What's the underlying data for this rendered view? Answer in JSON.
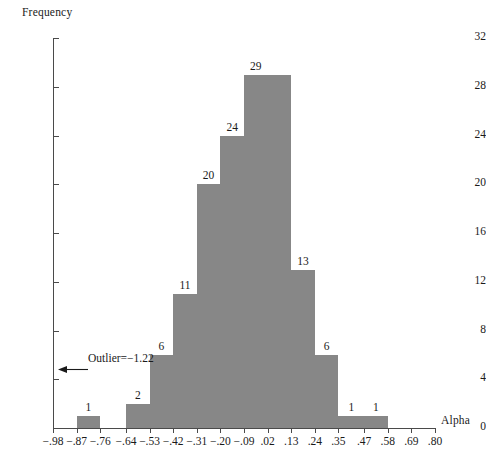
{
  "chart_data": {
    "type": "bar",
    "title": "",
    "subtitle": "",
    "xlabel": "Alpha",
    "ylabel": "Frequency",
    "grid": false,
    "legend": "none",
    "xlim": [
      -0.98,
      0.8
    ],
    "ylim": [
      0,
      32
    ],
    "bin_width": 0.11,
    "x_tick_labels": [
      "−.98",
      "−.87",
      "−.76",
      "−.64",
      "−.53",
      "−.42",
      "−.31",
      "−.20",
      "−.09",
      ".02",
      ".13",
      ".24",
      ".35",
      ".47",
      ".58",
      ".69",
      ".80"
    ],
    "x_tick_values": [
      -0.98,
      -0.87,
      -0.76,
      -0.64,
      -0.53,
      -0.42,
      -0.31,
      -0.2,
      -0.09,
      0.02,
      0.13,
      0.24,
      0.35,
      0.47,
      0.58,
      0.69,
      0.8
    ],
    "y_tick_labels": [
      "0",
      "4",
      "8",
      "12",
      "16",
      "20",
      "24",
      "28",
      "32"
    ],
    "y_tick_values": [
      0,
      4,
      8,
      12,
      16,
      20,
      24,
      28,
      32
    ],
    "bars": [
      {
        "bin_start": -0.87,
        "bin_end": -0.76,
        "value": 1,
        "label": "1"
      },
      {
        "bin_start": -0.64,
        "bin_end": -0.53,
        "value": 2,
        "label": "2"
      },
      {
        "bin_start": -0.53,
        "bin_end": -0.42,
        "value": 6,
        "label": "6"
      },
      {
        "bin_start": -0.42,
        "bin_end": -0.31,
        "value": 11,
        "label": "11"
      },
      {
        "bin_start": -0.31,
        "bin_end": -0.2,
        "value": 20,
        "label": "20"
      },
      {
        "bin_start": -0.2,
        "bin_end": -0.09,
        "value": 24,
        "label": "24"
      },
      {
        "bin_start": -0.09,
        "bin_end": 0.02,
        "value": 29,
        "label": "29"
      },
      {
        "bin_start": 0.02,
        "bin_end": 0.13,
        "value": 29,
        "label": ""
      },
      {
        "bin_start": 0.13,
        "bin_end": 0.24,
        "value": 13,
        "label": "13"
      },
      {
        "bin_start": 0.24,
        "bin_end": 0.35,
        "value": 6,
        "label": "6"
      },
      {
        "bin_start": 0.35,
        "bin_end": 0.47,
        "value": 1,
        "label": "1"
      },
      {
        "bin_start": 0.47,
        "bin_end": 0.58,
        "value": 1,
        "label": "1"
      }
    ],
    "annotations": [
      {
        "name": "outlier",
        "text": "Outlier=−1.22",
        "arrow": "left"
      }
    ],
    "colors": {
      "bar_fill": "#878787",
      "axis": "#4a4a4a",
      "text": "#1a1a1a",
      "background": "#ffffff"
    }
  }
}
